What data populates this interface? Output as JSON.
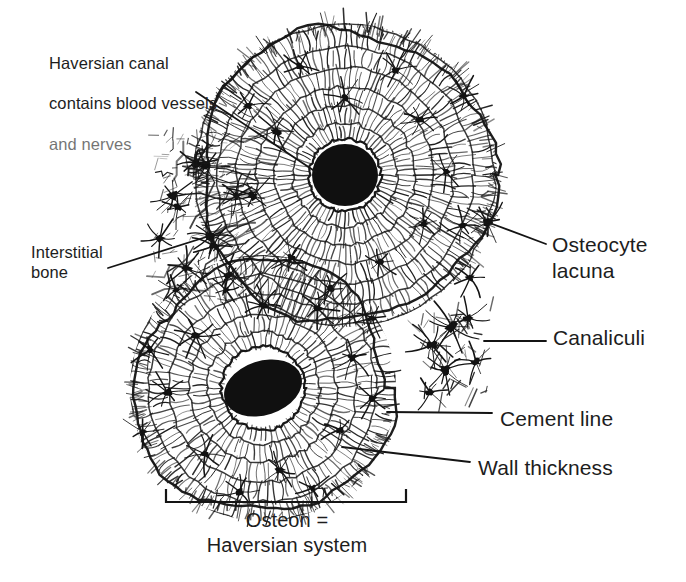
{
  "figure": {
    "type": "histology-diagram",
    "background_color": "#ffffff",
    "ink_color": "#1a1a1a"
  },
  "labels": {
    "haversian_canal": {
      "text": "Haversian canal\ncontains blood vessels\nand nerves",
      "lines": [
        "Haversian canal",
        "contains blood vessels",
        "and nerves"
      ],
      "faded_line": "and nerves"
    },
    "interstitial_bone": {
      "text": "Interstitial\nbone"
    },
    "osteocyte_lacuna": {
      "text": "Osteocyte\nlacuna"
    },
    "canaliculi": {
      "text": "Canaliculi"
    },
    "cement_line": {
      "text": "Cement line"
    },
    "wall_thickness": {
      "text": "Wall thickness"
    },
    "osteon_caption": {
      "text": "Osteon =\nHaversian system"
    }
  },
  "structures": {
    "upper_osteon": {
      "name": "upper-osteon",
      "center": [
        345,
        175
      ],
      "canal_radius": 33,
      "outer_radius": 152,
      "lamellae_count": 7
    },
    "lower_osteon": {
      "name": "lower-osteon",
      "center": [
        263,
        388
      ],
      "canal_rx": 40,
      "canal_ry": 27,
      "canal_rotation": -18,
      "outer_radius": 133,
      "lamellae_count": 6
    },
    "lacuna_cluster": {
      "name": "detached-lacuna-cluster",
      "center": [
        458,
        355
      ]
    },
    "interstitial_region": {
      "name": "interstitial-bone-region",
      "center": [
        205,
        215
      ]
    }
  },
  "leaders": {
    "haversian_canal": {
      "from": [
        196,
        92
      ],
      "to": [
        316,
        172
      ]
    },
    "interstitial_bone": {
      "from": [
        108,
        268
      ],
      "to": [
        222,
        232
      ]
    },
    "osteocyte_lacuna": {
      "from": [
        546,
        244
      ],
      "to": [
        487,
        222
      ]
    },
    "canaliculi": {
      "from": [
        546,
        341
      ],
      "to": [
        484,
        341
      ]
    },
    "cement_line": {
      "from": [
        492,
        413
      ],
      "to": [
        387,
        412
      ]
    },
    "wall_thickness": {
      "from": [
        470,
        462
      ],
      "to": [
        342,
        447
      ]
    }
  },
  "bracket": {
    "name": "osteon-span-bracket",
    "left_x": 166,
    "right_x": 406,
    "baseline_y": 502,
    "tick_height": 13
  }
}
